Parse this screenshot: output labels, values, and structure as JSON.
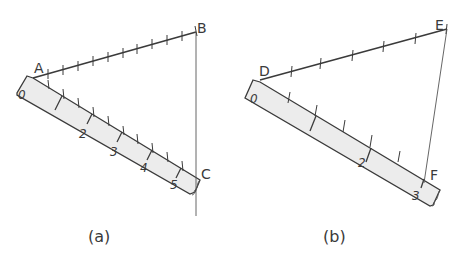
{
  "figure_a": {
    "caption": "(a)",
    "points": {
      "A": "A",
      "B": "B",
      "C": "C"
    },
    "ruler_numbers": [
      "0",
      "2",
      "3",
      "4",
      "5"
    ],
    "segment_AB_divisions": 11,
    "ruler_divisions_total": 5
  },
  "figure_b": {
    "caption": "(b)",
    "points": {
      "D": "D",
      "E": "E",
      "F": "F"
    },
    "ruler_numbers": [
      "0",
      "2",
      "3"
    ],
    "segment_DE_divisions": 6,
    "ruler_divisions_total": 3
  },
  "colors": {
    "ink": "#3a3a3a",
    "ruler_fill": "#ececec",
    "background": "#ffffff"
  }
}
